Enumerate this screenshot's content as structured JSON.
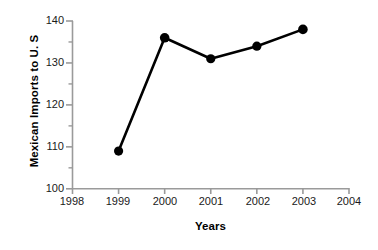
{
  "chart_data": {
    "type": "line",
    "title": "",
    "subtitle": "",
    "xlabel": "Years",
    "ylabel": "Mexican Imports to U. S",
    "x": [
      1999,
      2000,
      2001,
      2002,
      2003
    ],
    "values": [
      109,
      136,
      131,
      134,
      138
    ],
    "series": [
      {
        "name": "Mexican Imports to U. S",
        "x": [
          1999,
          2000,
          2001,
          2002,
          2003
        ],
        "values": [
          109,
          136,
          131,
          134,
          138
        ]
      }
    ],
    "xlim": [
      1998,
      2004
    ],
    "ylim": [
      100,
      140
    ],
    "x_tick_labels": [
      "1998",
      "1999",
      "2000",
      "2001",
      "2002",
      "2003",
      "2004"
    ],
    "x_ticks": [
      1998,
      1999,
      2000,
      2001,
      2002,
      2003,
      2004
    ],
    "y_tick_labels": [
      "100",
      "110",
      "120",
      "130",
      "140"
    ],
    "y_ticks": [
      100,
      110,
      120,
      130,
      140
    ],
    "y_minor_ticks": [
      105,
      115,
      125,
      135
    ],
    "grid": false,
    "legend": false,
    "legend_position": "none",
    "marker": "filled-circle",
    "line_color": "#000000",
    "marker_color": "#000000",
    "axis_color": "#9a9a9a",
    "background_color": "#ffffff",
    "annotations": []
  }
}
